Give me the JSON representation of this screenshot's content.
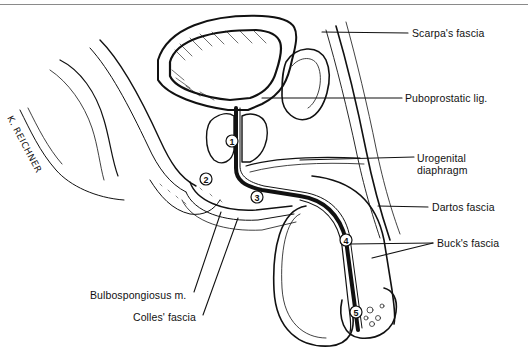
{
  "figure": {
    "signature": "K. REICHNER",
    "labels": [
      {
        "id": "scarpas-fascia",
        "text": "Scarpa's fascia",
        "x": 412,
        "y": 27
      },
      {
        "id": "puboprostatic-lig",
        "text": "Puboprostatic lig.",
        "x": 405,
        "y": 92
      },
      {
        "id": "urogenital-diaphragm-1",
        "text": "Urogenital",
        "x": 417,
        "y": 154
      },
      {
        "id": "urogenital-diaphragm-2",
        "text": "diaphragm",
        "x": 417,
        "y": 166
      },
      {
        "id": "dartos-fascia",
        "text": "Dartos fascia",
        "x": 432,
        "y": 202
      },
      {
        "id": "bucks-fascia",
        "text": "Buck's fascia",
        "x": 437,
        "y": 238
      },
      {
        "id": "bulbospongiosus-m",
        "text": "Bulbospongiosus m.",
        "x": 124,
        "y": 292
      },
      {
        "id": "colles-fascia",
        "text": "Colles' fascia",
        "x": 134,
        "y": 316
      }
    ],
    "numbered_markers": [
      {
        "n": "1",
        "x": 232,
        "y": 141
      },
      {
        "n": "2",
        "x": 206,
        "y": 179
      },
      {
        "n": "3",
        "x": 257,
        "y": 197
      },
      {
        "n": "4",
        "x": 346,
        "y": 240
      },
      {
        "n": "5",
        "x": 356,
        "y": 312
      }
    ],
    "colors": {
      "line": "#111111",
      "background": "#ffffff",
      "rule": "#8a8a8a"
    }
  }
}
